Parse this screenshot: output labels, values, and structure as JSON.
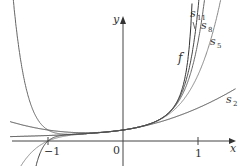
{
  "chart_data": {
    "type": "line",
    "title": "",
    "xlabel": "x",
    "ylabel": "y",
    "function": "f(x) = 1/(1 - x)",
    "partial_sums": "s_n(x) = 1 + x + x^2 + ... + x^n",
    "xlim": [
      -1.6,
      1.5
    ],
    "ylim": [
      -2,
      11
    ],
    "x_ticks": [
      {
        "value": -1,
        "label": "−1"
      },
      {
        "value": 0,
        "label": "0"
      },
      {
        "value": 1,
        "label": "1"
      }
    ],
    "grid": false,
    "legend": "inline labels",
    "series": [
      {
        "name": "f",
        "label": "f",
        "degree": null,
        "color": "#333333"
      },
      {
        "name": "s2",
        "label": "s",
        "subscript": "2",
        "degree": 2,
        "color": "#444444"
      },
      {
        "name": "s5",
        "label": "s",
        "subscript": "5",
        "degree": 5,
        "color": "#888888"
      },
      {
        "name": "s8",
        "label": "s",
        "subscript": "8",
        "degree": 8,
        "color": "#666666"
      },
      {
        "name": "s11",
        "label": "s",
        "subscript": "11",
        "degree": 11,
        "color": "#444444"
      }
    ]
  },
  "labels": {
    "x_axis": "x",
    "y_axis": "y",
    "origin": "0",
    "tick_neg1": "−1",
    "tick_1": "1",
    "f": "f",
    "s": "s",
    "s2_sub": "2",
    "s5_sub": "5",
    "s8_sub": "8",
    "s11_sub": "11"
  }
}
